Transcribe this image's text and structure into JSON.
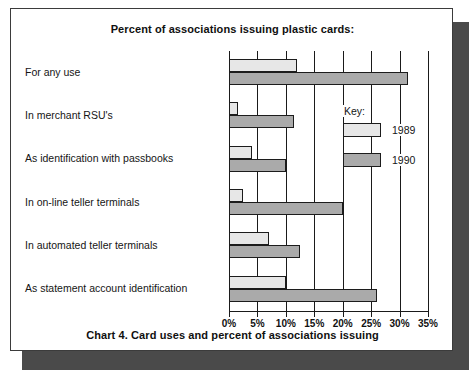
{
  "card": {
    "title": "Percent of associations issuing plastic cards:",
    "caption": "Chart 4. Card uses and percent of associations issuing"
  },
  "legend": {
    "title": "Key:",
    "entries": [
      {
        "label": "1989",
        "color": "#e7e7e7"
      },
      {
        "label": "1990",
        "color": "#aaaaaa"
      }
    ]
  },
  "chart_data": {
    "type": "bar",
    "orientation": "horizontal",
    "title": "Percent of associations issuing plastic cards:",
    "caption": "Chart 4. Card uses and percent of associations issuing",
    "xlabel": "",
    "ylabel": "",
    "xlim": [
      0,
      35
    ],
    "xticks": [
      0,
      5,
      10,
      15,
      20,
      25,
      30,
      35
    ],
    "xtick_labels": [
      "0%",
      "5%",
      "10%",
      "15%",
      "20%",
      "25%",
      "30%",
      "35%"
    ],
    "grid": true,
    "legend_position": "inside-upper-right",
    "categories": [
      "For any use",
      "In merchant RSU's",
      "As identification with passbooks",
      "In on-line teller terminals",
      "In automated teller terminals",
      "As statement account identification"
    ],
    "series": [
      {
        "name": "1989",
        "color": "#e7e7e7",
        "values": [
          12,
          1.5,
          4,
          2.5,
          7,
          10
        ]
      },
      {
        "name": "1990",
        "color": "#aaaaaa",
        "values": [
          31.5,
          11.5,
          10,
          20,
          12.5,
          26
        ]
      }
    ]
  }
}
